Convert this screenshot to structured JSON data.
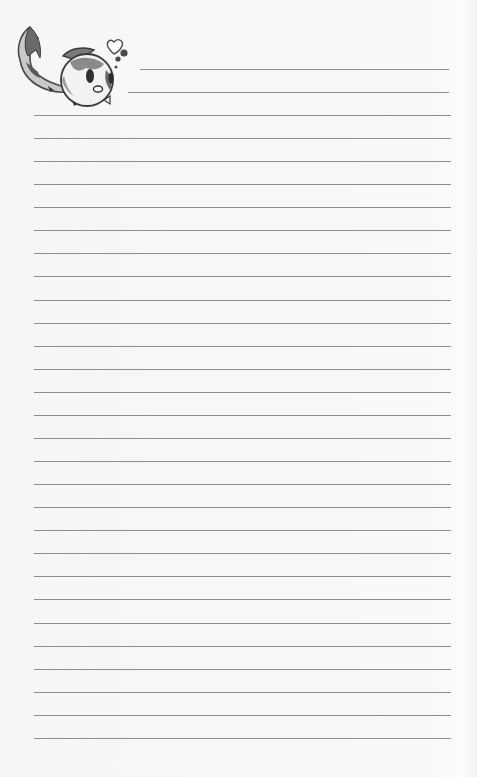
{
  "page": {
    "type": "lined-notepaper",
    "title": "",
    "background_color": "#f7f7f6",
    "line_color": "#8d8d8d"
  },
  "decoration": {
    "icon": "koi-fish-mascot-icon",
    "extras": [
      "heart-icon",
      "bubbles-icon"
    ]
  },
  "ruled_lines": {
    "header_lines": [
      {
        "top": 69,
        "left": 140,
        "right": 449
      },
      {
        "top": 92,
        "left": 128,
        "right": 449
      }
    ],
    "body_start": 115,
    "body_spacing": 23.07,
    "body_count": 28,
    "body_left": 34,
    "body_right": 451
  }
}
